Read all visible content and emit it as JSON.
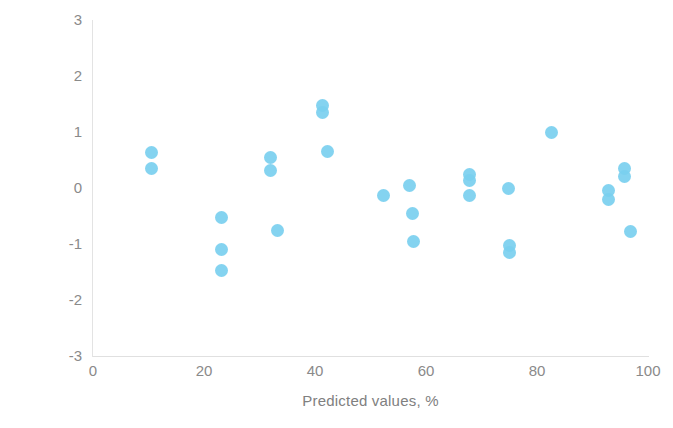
{
  "chart_data": {
    "type": "scatter",
    "title": "",
    "xlabel": "Predicted values, %",
    "ylabel": "Residuals, %",
    "xlim": [
      0,
      100
    ],
    "ylim": [
      -3,
      3
    ],
    "xticks": [
      0,
      20,
      40,
      60,
      80,
      100
    ],
    "yticks": [
      3,
      2,
      1,
      0,
      -1,
      -2,
      -3
    ],
    "xtick_labels": [
      "0",
      "20",
      "40",
      "60",
      "80",
      "100"
    ],
    "ytick_labels": [
      "3",
      "2",
      "1",
      "0",
      "-1",
      "-2",
      "-3"
    ],
    "grid": false,
    "legend": false,
    "marker_color": "#7ACFEF",
    "marker_size": 13,
    "series": [
      {
        "name": "Residuals",
        "points": [
          {
            "x": 10.5,
            "y": 0.63
          },
          {
            "x": 10.5,
            "y": 0.35
          },
          {
            "x": 23.2,
            "y": -0.52
          },
          {
            "x": 23.2,
            "y": -1.09
          },
          {
            "x": 23.2,
            "y": -1.48
          },
          {
            "x": 31.9,
            "y": 0.55
          },
          {
            "x": 31.9,
            "y": 0.32
          },
          {
            "x": 33.3,
            "y": -0.75
          },
          {
            "x": 41.3,
            "y": 1.48
          },
          {
            "x": 41.3,
            "y": 1.34
          },
          {
            "x": 42.2,
            "y": 0.66
          },
          {
            "x": 52.3,
            "y": -0.14
          },
          {
            "x": 57.1,
            "y": 0.04
          },
          {
            "x": 57.5,
            "y": -0.45
          },
          {
            "x": 57.7,
            "y": -0.95
          },
          {
            "x": 67.9,
            "y": 0.25
          },
          {
            "x": 67.9,
            "y": 0.13
          },
          {
            "x": 67.9,
            "y": -0.14
          },
          {
            "x": 74.8,
            "y": 0.0
          },
          {
            "x": 75.0,
            "y": -1.02
          },
          {
            "x": 75.0,
            "y": -1.16
          },
          {
            "x": 82.7,
            "y": 1.0
          },
          {
            "x": 92.8,
            "y": -0.04
          },
          {
            "x": 92.8,
            "y": -0.21
          },
          {
            "x": 95.7,
            "y": 0.34
          },
          {
            "x": 95.7,
            "y": 0.21
          },
          {
            "x": 96.8,
            "y": -0.77
          }
        ]
      }
    ]
  },
  "axes": {
    "y_title": "Residuals, %",
    "x_title": "Predicted values, %"
  }
}
